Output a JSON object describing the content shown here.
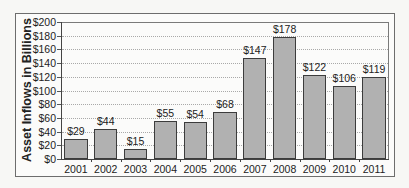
{
  "chart_data": {
    "type": "bar",
    "title": "",
    "xlabel": "",
    "ylabel": "Asset Inflows in Billions",
    "ylim": [
      0,
      200
    ],
    "yticks": [
      "$0",
      "$20",
      "$40",
      "$60",
      "$80",
      "$100",
      "$120",
      "$140",
      "$160",
      "$180",
      "$200"
    ],
    "grid": "horizontal dotted",
    "legend": "none",
    "categories": [
      "2001",
      "2002",
      "2003",
      "2004",
      "2005",
      "2006",
      "2007",
      "2008",
      "2009",
      "2010",
      "2011"
    ],
    "values": [
      29,
      44,
      15,
      55,
      54,
      68,
      147,
      178,
      122,
      106,
      119
    ],
    "data_labels": [
      "$29",
      "$44",
      "$15",
      "$55",
      "$54",
      "$68",
      "$147",
      "$178",
      "$122",
      "$106",
      "$119"
    ],
    "bar_color": "#b1b1b1"
  }
}
